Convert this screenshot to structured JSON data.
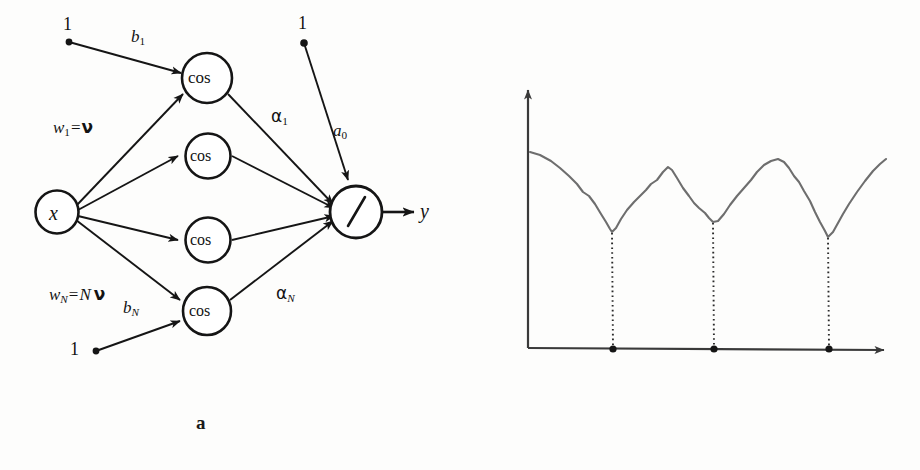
{
  "figure": {
    "panels": [
      {
        "id": "a",
        "caption": "a",
        "kind": "diagram"
      },
      {
        "id": "b",
        "caption": "b",
        "kind": "chart"
      }
    ],
    "ink_color": "#151515",
    "curve_color": "#6e6e6e"
  },
  "diagram": {
    "input_node": {
      "label": "x",
      "name": "input-node"
    },
    "hidden_nodes": [
      {
        "label": "cos"
      },
      {
        "label": "cos"
      },
      {
        "label": "cos"
      },
      {
        "label": "cos"
      }
    ],
    "output_node": {
      "label": "/",
      "name": "division-node"
    },
    "output_label": "y",
    "bias_sources": [
      {
        "label": "1",
        "edge_label_base": "b",
        "edge_label_sub": "1"
      },
      {
        "label": "1",
        "edge_label_base": "b",
        "edge_label_sub": "N"
      },
      {
        "label": "1",
        "edge_label_base": "a",
        "edge_label_sub": "0"
      }
    ],
    "edge_labels": {
      "w1": {
        "base": "w",
        "sub": "1",
        "eq": "=",
        "rhs": "ν"
      },
      "wN": {
        "base": "w",
        "sub": "N",
        "eq": "=",
        "rhs_coef": "N",
        "rhs": "ν"
      },
      "alpha1": {
        "base": "α",
        "sub": "1"
      },
      "alphaN": {
        "base": "α",
        "sub": "N"
      },
      "b1": {
        "base": "b",
        "sub": "1"
      },
      "bN": {
        "base": "b",
        "sub": "N"
      },
      "a0": {
        "base": "a",
        "sub": "0"
      }
    }
  },
  "chart_data": {
    "type": "line",
    "title": "",
    "ylabel": "Cost",
    "xlabel": "ν",
    "grid": false,
    "legend": null,
    "axes": {
      "arrowheads": true,
      "x_range_px": [
        528,
        888
      ],
      "y_range_px": [
        348,
        88
      ]
    },
    "annotations": [
      {
        "text": "ν",
        "sub": "1",
        "x_px": 612,
        "kind": "x-tick-minimum",
        "dotted_drop": true
      },
      {
        "text": "ν",
        "sub": "2",
        "x_px": 713,
        "kind": "x-tick-minimum",
        "dotted_drop": true
      },
      {
        "text": "ν",
        "sub": "3",
        "x_px": 828,
        "kind": "x-tick-minimum",
        "dotted_drop": true
      }
    ],
    "x_tick_labels": [
      "ν₁",
      "ν₂",
      "ν₃"
    ],
    "points": [
      [
        530,
        152
      ],
      [
        540,
        155
      ],
      [
        551,
        161
      ],
      [
        560,
        168
      ],
      [
        569,
        176
      ],
      [
        577,
        184
      ],
      [
        583,
        192
      ],
      [
        589,
        196
      ],
      [
        595,
        204
      ],
      [
        601,
        214
      ],
      [
        606,
        222
      ],
      [
        610,
        229
      ],
      [
        612,
        232
      ],
      [
        616,
        228
      ],
      [
        621,
        219
      ],
      [
        627,
        210
      ],
      [
        634,
        202
      ],
      [
        640,
        196
      ],
      [
        646,
        190
      ],
      [
        651,
        184
      ],
      [
        657,
        180
      ],
      [
        663,
        172
      ],
      [
        668,
        167
      ],
      [
        672,
        170
      ],
      [
        677,
        178
      ],
      [
        683,
        188
      ],
      [
        689,
        196
      ],
      [
        694,
        203
      ],
      [
        699,
        208
      ],
      [
        705,
        213
      ],
      [
        709,
        218
      ],
      [
        713,
        222
      ],
      [
        718,
        221
      ],
      [
        724,
        214
      ],
      [
        730,
        205
      ],
      [
        737,
        196
      ],
      [
        744,
        188
      ],
      [
        751,
        180
      ],
      [
        757,
        172
      ],
      [
        764,
        165
      ],
      [
        771,
        161
      ],
      [
        778,
        159
      ],
      [
        784,
        162
      ],
      [
        789,
        168
      ],
      [
        794,
        176
      ],
      [
        799,
        182
      ],
      [
        804,
        191
      ],
      [
        810,
        201
      ],
      [
        815,
        212
      ],
      [
        820,
        222
      ],
      [
        825,
        231
      ],
      [
        828,
        237
      ],
      [
        833,
        232
      ],
      [
        838,
        223
      ],
      [
        843,
        214
      ],
      [
        849,
        204
      ],
      [
        857,
        192
      ],
      [
        865,
        181
      ],
      [
        873,
        171
      ],
      [
        880,
        164
      ],
      [
        886,
        159
      ]
    ]
  }
}
